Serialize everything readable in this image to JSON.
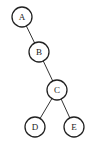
{
  "diagram": {
    "type": "binary-tree",
    "nodes": [
      {
        "id": "A",
        "label": "A",
        "cx": 22,
        "cy": 17
      },
      {
        "id": "B",
        "label": "B",
        "cx": 39,
        "cy": 52
      },
      {
        "id": "C",
        "label": "C",
        "cx": 57,
        "cy": 90
      },
      {
        "id": "D",
        "label": "D",
        "cx": 35,
        "cy": 127
      },
      {
        "id": "E",
        "label": "E",
        "cx": 74,
        "cy": 127
      }
    ],
    "edges": [
      {
        "from": "A",
        "to": "B"
      },
      {
        "from": "B",
        "to": "C"
      },
      {
        "from": "C",
        "to": "D"
      },
      {
        "from": "C",
        "to": "E"
      }
    ],
    "node_radius": 10
  }
}
